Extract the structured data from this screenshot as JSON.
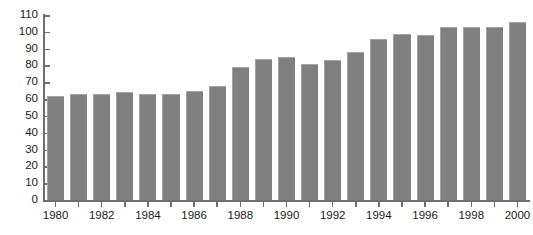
{
  "chart_data": {
    "type": "bar",
    "title": "",
    "subtitle": "",
    "xlabel": "",
    "ylabel": "",
    "grid": false,
    "legend": null,
    "bar_color": "#808080",
    "axis_color": "#6e6e6e",
    "text_color": "#1a1a1a",
    "ylim": [
      0,
      110
    ],
    "ytick_step": 10,
    "ytick_labels": [
      "110",
      "100",
      "90",
      "80",
      "70",
      "60",
      "50",
      "40",
      "30",
      "20",
      "10",
      "0"
    ],
    "ytick_values": [
      110,
      100,
      90,
      80,
      70,
      60,
      50,
      40,
      30,
      20,
      10,
      0
    ],
    "xtick_labels": [
      "1980",
      "1982",
      "1984",
      "1986",
      "1988",
      "1990",
      "1992",
      "1994",
      "1996",
      "1998",
      "2000"
    ],
    "xtick_values": [
      1980,
      1982,
      1984,
      1986,
      1988,
      1990,
      1992,
      1994,
      1996,
      1998,
      2000
    ],
    "categories": [
      "1980",
      "1981",
      "1982",
      "1983",
      "1984",
      "1985",
      "1986",
      "1987",
      "1988",
      "1989",
      "1990",
      "1991",
      "1992",
      "1993",
      "1994",
      "1995",
      "1996",
      "1997",
      "1998",
      "1999",
      "2000"
    ],
    "values": [
      62,
      63,
      63,
      64,
      63,
      63,
      65,
      68,
      79,
      84,
      85,
      81,
      83,
      88,
      96,
      99,
      98,
      103,
      103,
      103,
      106
    ]
  }
}
